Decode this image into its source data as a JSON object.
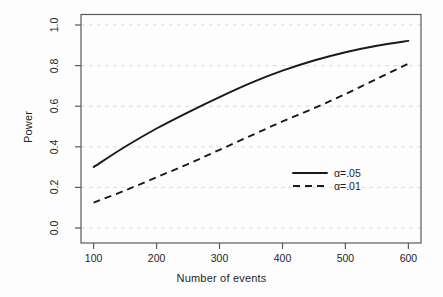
{
  "chart_data": {
    "type": "line",
    "title": "",
    "xlabel": "Number of events",
    "ylabel": "Power",
    "xlim": [
      80,
      620
    ],
    "ylim": [
      0.0,
      1.0
    ],
    "xticks": [
      100,
      200,
      300,
      400,
      500,
      600
    ],
    "xtick_labels": [
      "100",
      "200",
      "300",
      "400",
      "500",
      "600"
    ],
    "yticks": [
      0.0,
      0.2,
      0.4,
      0.6,
      0.8,
      1.0
    ],
    "ytick_labels": [
      "0.0",
      "0.2",
      "0.4",
      "0.6",
      "0.8",
      "1.0"
    ],
    "grid": "horizontal-dashed-light",
    "legend_position": "center-right-inside",
    "x": [
      100,
      150,
      200,
      250,
      300,
      350,
      400,
      450,
      500,
      550,
      600
    ],
    "series": [
      {
        "name": "alpha-05",
        "label": "α=.05",
        "style": "solid",
        "color": "#1a1a1a",
        "values": [
          0.3,
          0.4,
          0.49,
          0.57,
          0.645,
          0.715,
          0.775,
          0.825,
          0.866,
          0.898,
          0.922
        ]
      },
      {
        "name": "alpha-01",
        "label": "α=.01",
        "style": "dashed",
        "color": "#1a1a1a",
        "values": [
          0.125,
          0.185,
          0.25,
          0.315,
          0.385,
          0.455,
          0.525,
          0.59,
          0.66,
          0.735,
          0.81
        ]
      }
    ]
  },
  "legend": {
    "items": [
      {
        "label": "α=.05",
        "style": "solid"
      },
      {
        "label": "α=.01",
        "style": "dashed"
      }
    ]
  },
  "colors": {
    "line": "#1a1a1a",
    "grid": "#d9d9d9",
    "frame": "#555555",
    "background": "#fdfdfd"
  }
}
